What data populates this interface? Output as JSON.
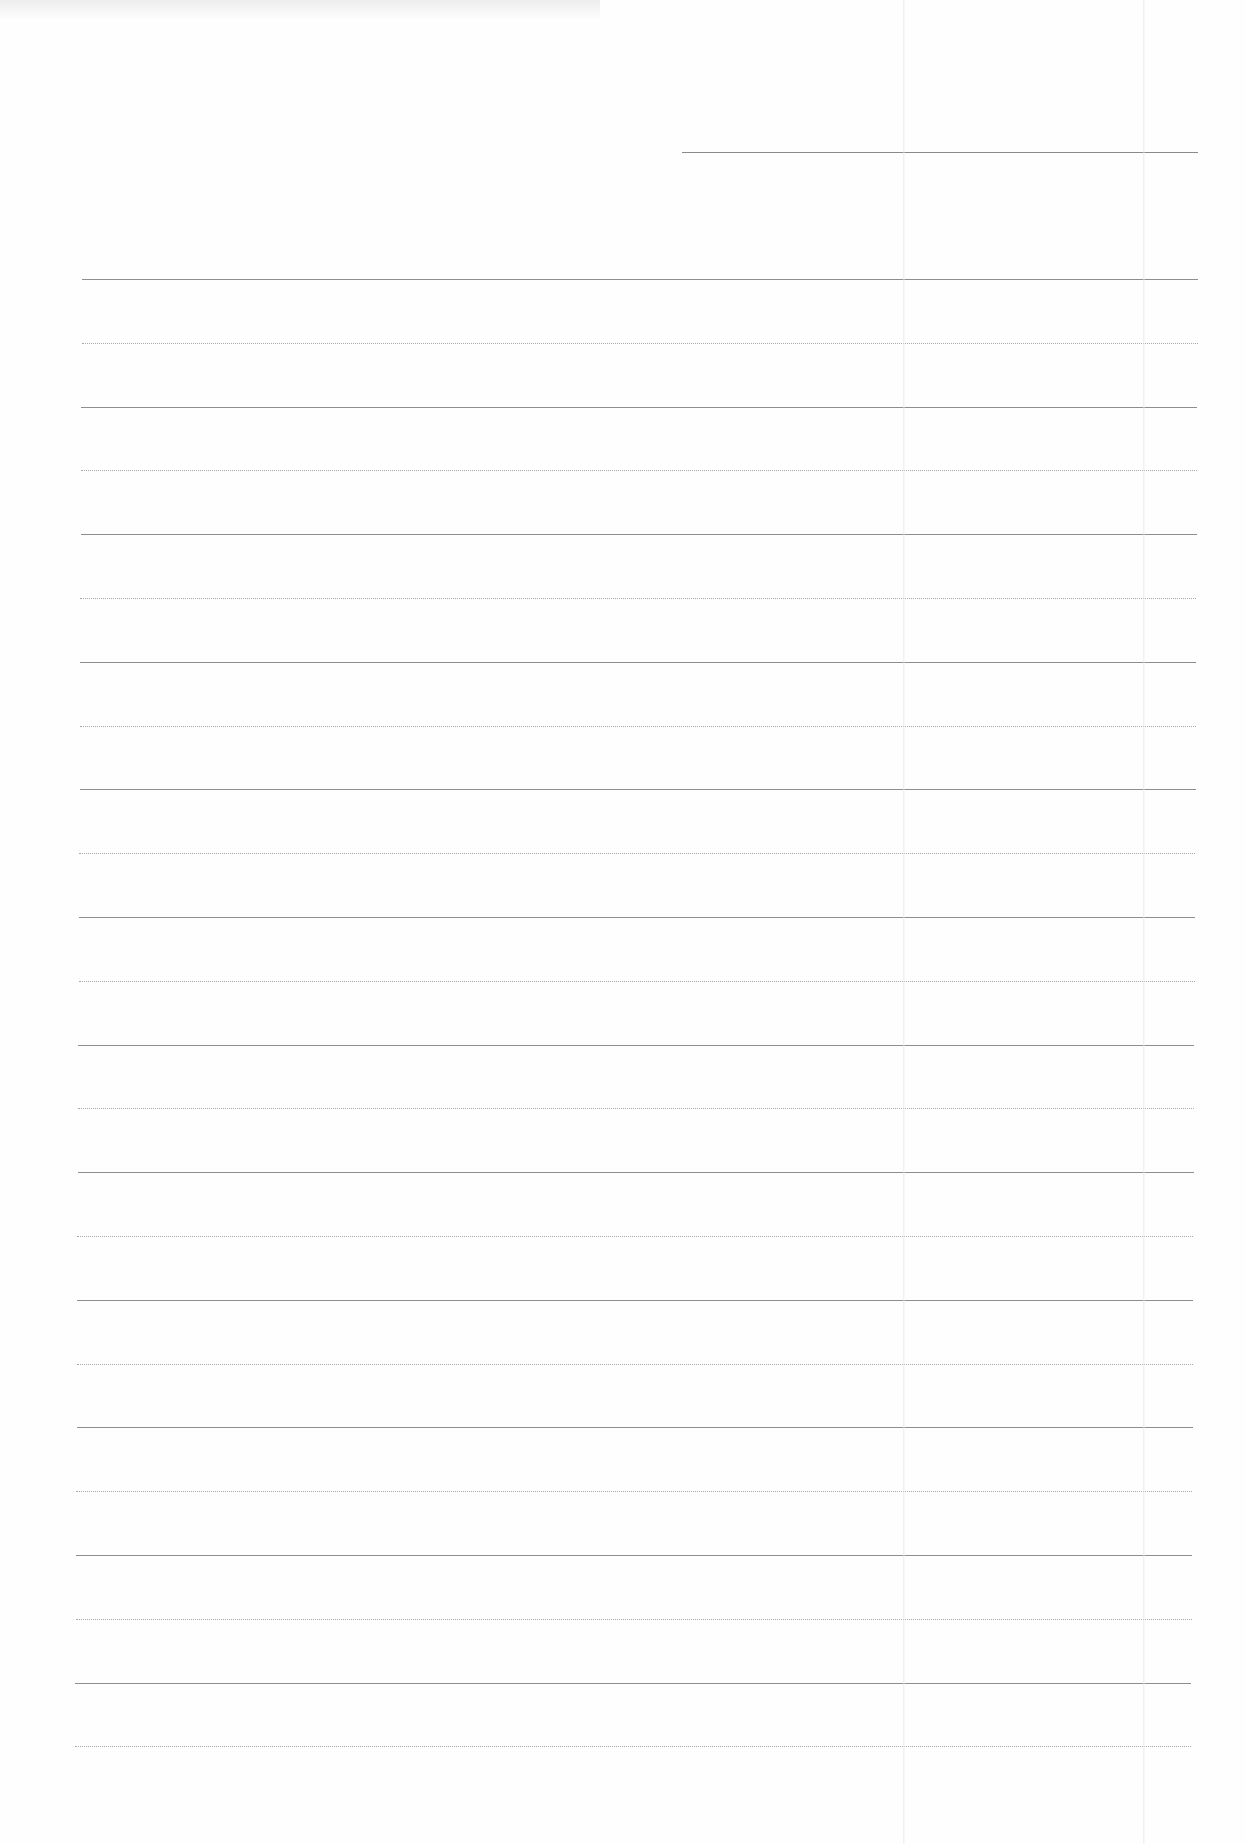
{
  "document": {
    "type": "lined-paper",
    "background": "#fefefe",
    "line_color_solid": "#8e8e8e",
    "line_color_dotted": "#a8a8a8",
    "header_line": {
      "x": 682,
      "y": 152,
      "width": 516
    },
    "rules_start_y": 279,
    "rule_spacing": 63.8,
    "rule_left": 82,
    "rule_right": 1198,
    "rule_count": 24,
    "pattern": [
      "solid",
      "dotted"
    ],
    "fold_lines_x": [
      903,
      1143
    ]
  }
}
